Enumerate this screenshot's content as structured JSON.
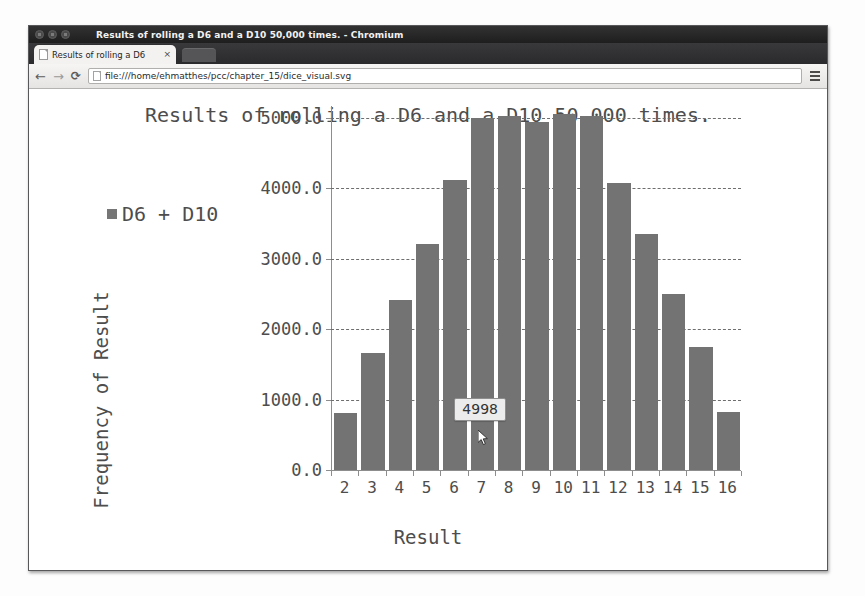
{
  "window": {
    "title": "Results of rolling a D6 and a D10 50,000 times. - Chromium",
    "controls": [
      "close",
      "minimize",
      "maximize"
    ]
  },
  "tab": {
    "label": "Results of rolling a D6",
    "close_label": "×",
    "favicon": "document-icon"
  },
  "toolbar": {
    "back_icon": "←",
    "forward_icon": "→",
    "reload_icon": "⟳",
    "menu_icon": "hamburger-menu-icon",
    "url": "file:///home/ehmatthes/pcc/chapter_15/dice_visual.svg"
  },
  "chart_data": {
    "type": "bar",
    "title": "Results of rolling a D6 and a D10 50,000 times.",
    "xlabel": "Result",
    "ylabel": "Frequency of Result",
    "legend": [
      {
        "name": "D6 + D10",
        "color": "#767676"
      }
    ],
    "legend_position": "top-left",
    "grid": true,
    "categories": [
      "2",
      "3",
      "4",
      "5",
      "6",
      "7",
      "8",
      "9",
      "10",
      "11",
      "12",
      "13",
      "14",
      "15",
      "16"
    ],
    "values": [
      806,
      1668,
      2420,
      3217,
      4120,
      4998,
      5032,
      4940,
      5060,
      5023,
      4083,
      3350,
      2507,
      1751,
      829
    ],
    "ylim": [
      0,
      5000
    ],
    "yticks": [
      0,
      1000,
      2000,
      3000,
      4000,
      5000
    ],
    "ytick_labels": [
      "0.0",
      "1000.0",
      "2000.0",
      "3000.0",
      "4000.0",
      "5000.0"
    ],
    "bar_color": "#737373",
    "tooltip": {
      "visible": true,
      "text": "4998",
      "category": "7"
    }
  }
}
